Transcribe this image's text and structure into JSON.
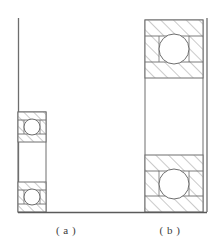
{
  "figure": {
    "type": "engineering-line-drawing",
    "width": 222,
    "height": 247,
    "background_color": "#ffffff",
    "line_color": "#6e6e6e",
    "hatch_color": "#8a8a8a",
    "axis_color": "#5a5a5a"
  },
  "captions": {
    "a": "( a )",
    "b": "( b )"
  },
  "panels": [
    {
      "id": "a",
      "label": "( a )",
      "shaft_line_x": 18,
      "shaft_line_top": 18,
      "shaft_line_bottom": 212,
      "housing": {
        "x": 18,
        "y": 112,
        "width": 28,
        "height": 100
      },
      "bearings": [
        {
          "name": "upper-bearing",
          "x": 18,
          "y": 112,
          "width": 28,
          "height": 30,
          "ball_cx": 32,
          "ball_cy": 127,
          "ball_r": 8
        },
        {
          "name": "lower-bearing",
          "x": 18,
          "y": 182,
          "width": 28,
          "height": 30,
          "ball_cx": 32,
          "ball_cy": 197,
          "ball_r": 8
        }
      ],
      "gap": {
        "x": 18,
        "y": 142,
        "width": 28,
        "height": 40
      }
    },
    {
      "id": "b",
      "label": "( b )",
      "shaft_line_x": 207,
      "shaft_line_top": 18,
      "shaft_line_bottom": 212,
      "housing": {
        "x": 145,
        "y": 20,
        "width": 58,
        "height": 192
      },
      "bearings": [
        {
          "name": "upper-bearing",
          "x": 145,
          "y": 20,
          "width": 58,
          "height": 58,
          "ball_cx": 174,
          "ball_cy": 49,
          "ball_r": 15
        },
        {
          "name": "lower-bearing",
          "x": 145,
          "y": 155,
          "width": 58,
          "height": 57,
          "ball_cx": 174,
          "ball_cy": 184,
          "ball_r": 15
        }
      ],
      "gap": {
        "x": 145,
        "y": 78,
        "width": 58,
        "height": 77
      }
    }
  ],
  "baseline": {
    "x1": 18,
    "x2": 207,
    "y": 212
  }
}
